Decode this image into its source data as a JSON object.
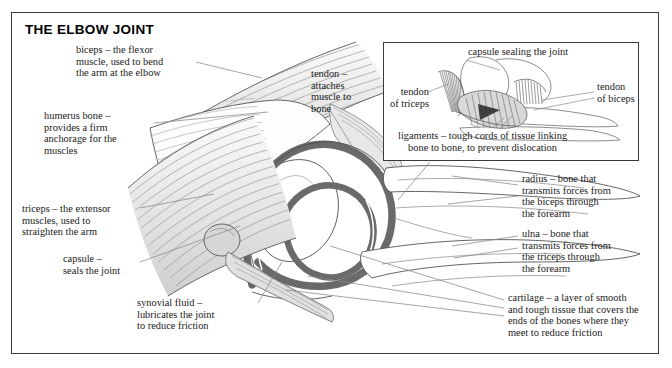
{
  "page": {
    "title": "THE ELBOW JOINT"
  },
  "colors": {
    "frame_border": "#3a3a3a",
    "text": "#1a1a1a",
    "cartilage_band": "#6a6a6a",
    "muscle_striation": "#8c8c8c",
    "bone_outline": "#4a4a4a",
    "leader_line": "#808080",
    "background": "#ffffff"
  },
  "labels": {
    "biceps": {
      "lines": [
        "biceps – the flexor",
        "muscle, used to bend",
        "the arm at the elbow"
      ]
    },
    "humerus": {
      "lines": [
        "humerus bone –",
        "provides a firm",
        "anchorage for the",
        "muscles"
      ]
    },
    "triceps": {
      "lines": [
        "triceps – the extensor",
        "muscles, used to",
        "straighten the arm"
      ]
    },
    "capsule": {
      "lines": [
        "capsule –",
        "seals the joint"
      ]
    },
    "synovial": {
      "lines": [
        "synovial fluid –",
        "lubricates the joint",
        "to reduce friction"
      ]
    },
    "tendon": {
      "lines": [
        "tendon –",
        "attaches",
        "muscle to",
        "bone"
      ]
    },
    "radius": {
      "lines": [
        "radius – bone that",
        "transmits forces from",
        "the biceps through",
        "the forearm"
      ]
    },
    "ulna": {
      "lines": [
        "ulna – bone that",
        "transmits forces from",
        "the triceps through",
        "the forearm"
      ]
    },
    "cartilage": {
      "lines": [
        "cartilage – a layer of smooth",
        "and tough tissue that covers the",
        "ends of the bones where they",
        "meet to reduce friction"
      ]
    }
  },
  "inset": {
    "capsule_sealing": {
      "lines": [
        "capsule sealing the joint"
      ]
    },
    "tendon_triceps": {
      "lines": [
        "tendon",
        "of triceps"
      ]
    },
    "tendon_biceps": {
      "lines": [
        "tendon",
        "of biceps"
      ]
    },
    "ligaments": {
      "lines": [
        "ligaments – tough cords of tissue linking",
        "bone to bone, to prevent dislocation"
      ]
    }
  }
}
